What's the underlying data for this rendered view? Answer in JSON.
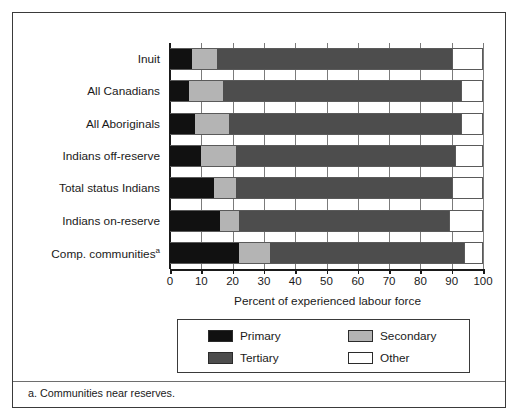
{
  "chart_data": {
    "type": "bar",
    "orientation": "horizontal",
    "stacked": true,
    "stack_mode": "percent",
    "title": "",
    "xlabel": "Percent of experienced labour force",
    "ylabel": "",
    "xlim": [
      0,
      100
    ],
    "xticks": [
      0,
      10,
      20,
      30,
      40,
      50,
      60,
      70,
      80,
      90,
      100
    ],
    "xticklabels": [
      "0",
      "10",
      "20",
      "30",
      "40",
      "50",
      "60",
      "70",
      "80",
      "90",
      "100"
    ],
    "grid": true,
    "grid_axis": "x",
    "legend_position": "bottom",
    "categories": [
      "Inuit",
      "All Canadians",
      "All Aboriginals",
      "Indians off-reserve",
      "Total status Indians",
      "Indians on-reserve",
      "Comp. communities"
    ],
    "category_footnote_markers": [
      "",
      "",
      "",
      "",
      "",
      "",
      "a"
    ],
    "series": [
      {
        "name": "Primary",
        "color": "#111111",
        "values": [
          7,
          6,
          8,
          10,
          14,
          16,
          22
        ]
      },
      {
        "name": "Secondary",
        "color": "#b4b4b4",
        "values": [
          8,
          11,
          11,
          11,
          7,
          6,
          10
        ]
      },
      {
        "name": "Tertiary",
        "color": "#4d4d4d",
        "values": [
          75,
          76,
          74,
          70,
          69,
          67,
          62
        ]
      },
      {
        "name": "Other",
        "color": "#ffffff",
        "values": [
          10,
          7,
          7,
          9,
          10,
          11,
          6
        ]
      }
    ],
    "stack_order": [
      "Primary",
      "Secondary",
      "Tertiary",
      "Other"
    ],
    "annotations": []
  },
  "legend": {
    "entries": [
      {
        "label": "Primary",
        "swatch": "sw-primary"
      },
      {
        "label": "Tertiary",
        "swatch": "sw-tertiary"
      },
      {
        "label": "Secondary",
        "swatch": "sw-secondary"
      },
      {
        "label": "Other",
        "swatch": "sw-other"
      }
    ]
  },
  "footnote": "a. Communities near reserves."
}
